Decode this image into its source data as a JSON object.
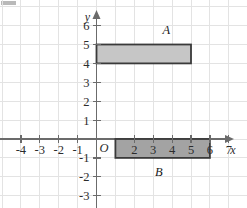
{
  "figure": {
    "type": "coordinate-plane",
    "background_color": "#ffffff",
    "grid_color": "#e3e3e3",
    "axis_color": "#6b6b6b",
    "grid_on": true
  },
  "axes": {
    "x": {
      "name": "x",
      "min": -5,
      "max": 8,
      "tick_labels": [
        "-4",
        "-3",
        "-2",
        "-1",
        "2",
        "3",
        "4",
        "5",
        "6",
        "7"
      ],
      "tick_values": [
        -4,
        -3,
        -2,
        -1,
        2,
        3,
        4,
        5,
        6,
        7
      ],
      "arrow": true
    },
    "y": {
      "name": "y",
      "min": -3,
      "max": 6,
      "tick_labels": [
        "6",
        "5",
        "4",
        "3",
        "2",
        "1",
        "-1",
        "-2",
        "-3"
      ],
      "tick_values": [
        6,
        5,
        4,
        3,
        2,
        1,
        -1,
        -2,
        -3
      ],
      "arrow": true
    },
    "origin_label": "O"
  },
  "shapes": [
    {
      "label": "A",
      "kind": "rectangle",
      "x_min": 0,
      "x_max": 5,
      "y_min": 4,
      "y_max": 5,
      "fill": "#c6c6c6",
      "stroke": "#3a3a3a",
      "label_x": 3.7,
      "label_y": 5.75
    },
    {
      "label": "B",
      "kind": "rectangle",
      "x_min": 1,
      "x_max": 6,
      "y_min": -1,
      "y_max": 0,
      "fill": "#a3a3a3",
      "stroke": "#3a3a3a",
      "label_x": 3.3,
      "label_y": -1.75
    }
  ],
  "chart_data": {
    "type": "scatter",
    "title": "",
    "xlabel": "x",
    "ylabel": "y",
    "xlim": [
      -5,
      8
    ],
    "ylim": [
      -3,
      6
    ],
    "grid": true,
    "annotations": [
      "A",
      "B",
      "O"
    ],
    "rectangles": [
      {
        "name": "A",
        "corners": [
          [
            0,
            4
          ],
          [
            5,
            4
          ],
          [
            5,
            5
          ],
          [
            0,
            5
          ]
        ]
      },
      {
        "name": "B",
        "corners": [
          [
            1,
            -1
          ],
          [
            6,
            -1
          ],
          [
            6,
            0
          ],
          [
            1,
            0
          ]
        ]
      }
    ]
  }
}
